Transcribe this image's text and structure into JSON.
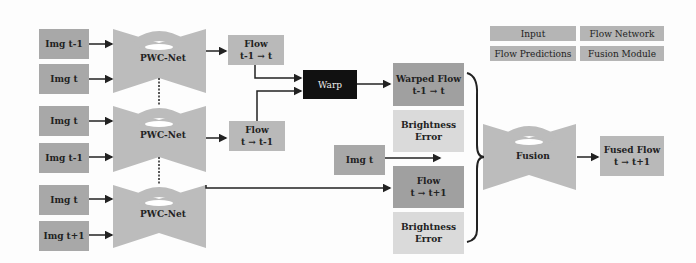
{
  "legend": {
    "input": "Input",
    "flow_network": "Flow Network",
    "flow_predictions": "Flow Predictions",
    "fusion_module": "Fusion Module"
  },
  "inputs": [
    {
      "label": "Img t-1"
    },
    {
      "label": "Img t"
    },
    {
      "label": "Img t"
    },
    {
      "label": "Img t-1"
    },
    {
      "label": "Img t"
    },
    {
      "label": "Img t+1"
    }
  ],
  "networks": [
    {
      "label": "PWC-Net"
    },
    {
      "label": "PWC-Net"
    },
    {
      "label": "PWC-Net"
    }
  ],
  "flows": {
    "flow_a": {
      "title": "Flow",
      "sub": "t-1 → t"
    },
    "flow_b": {
      "title": "Flow",
      "sub": "t → t-1"
    },
    "warp": "Warp",
    "warped": {
      "title": "Warped Flow",
      "sub": "t-1 → t"
    },
    "bright1": {
      "title": "Brightness",
      "sub": "Error"
    },
    "img_t": "Img t",
    "flow_c": {
      "title": "Flow",
      "sub": "t → t+1"
    },
    "bright2": {
      "title": "Brightness",
      "sub": "Error"
    }
  },
  "fusion": {
    "label": "Fusion"
  },
  "output": {
    "title": "Fused Flow",
    "sub": "t → t+1"
  },
  "colors": {
    "input": "#a8a8a8",
    "network": "#bcbcbc",
    "warp": "#111111",
    "light": "#dadada"
  }
}
